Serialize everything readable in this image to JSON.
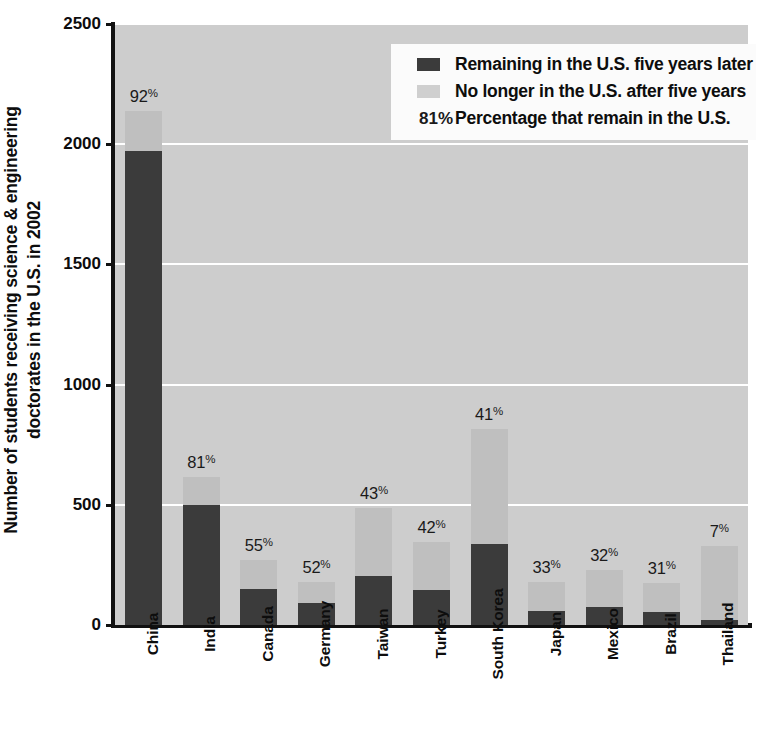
{
  "chart_data": {
    "type": "bar",
    "subtype": "stacked",
    "title": "",
    "xlabel": "",
    "ylabel": "Number of students receiving science & engineering doctorates in the U.S. in 2002",
    "ylabel_lines": [
      "Number of students receiving science & engineering",
      "doctorates in the U.S. in 2002"
    ],
    "ylim": [
      0,
      2500
    ],
    "yticks": [
      0,
      500,
      1000,
      1500,
      2000,
      2500
    ],
    "ytick_labels": [
      "0",
      "500",
      "1000",
      "1500",
      "2000",
      "2500"
    ],
    "grid": true,
    "grid_color": "#ffffff",
    "plot_background": "#cdcdcd",
    "legend_position": "upper right",
    "categories": [
      "China",
      "India",
      "Canada",
      "Germany",
      "Taiwan",
      "Turkey",
      "South Korea",
      "Japan",
      "Mexico",
      "Brazil",
      "Thailand"
    ],
    "series": [
      {
        "name": "Remaining in the U.S. five years later",
        "color": "#3b3b3b",
        "values": [
          1970,
          500,
          148,
          93,
          205,
          145,
          335,
          60,
          75,
          55,
          22
        ]
      },
      {
        "name": "No longer in the U.S. after five years",
        "color": "#bfbfbf",
        "values": [
          170,
          115,
          122,
          87,
          280,
          200,
          480,
          120,
          155,
          120,
          308
        ]
      }
    ],
    "totals": [
      2140,
      615,
      270,
      180,
      485,
      345,
      815,
      180,
      230,
      175,
      330
    ],
    "percent_labels": [
      "92%",
      "81%",
      "55%",
      "52%",
      "43%",
      "42%",
      "41%",
      "33%",
      "32%",
      "31%",
      "7%"
    ],
    "percent_values": [
      92,
      81,
      55,
      52,
      43,
      42,
      41,
      33,
      32,
      31,
      7
    ],
    "annotation_note": "Percentage that remain in the U.S."
  },
  "legend": {
    "rows": [
      {
        "key_type": "swatch-dark",
        "label": "Remaining in the U.S. five years later"
      },
      {
        "key_type": "swatch-light",
        "label": "No longer in the U.S. after five years"
      },
      {
        "key_type": "percent",
        "key_text": "81%",
        "label": "Percentage that remain in the U.S."
      }
    ]
  }
}
